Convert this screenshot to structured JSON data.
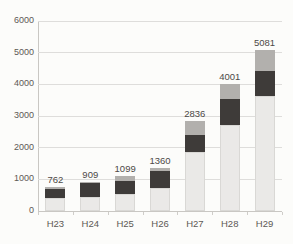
{
  "chart_data": {
    "type": "bar",
    "stacked": true,
    "title": "",
    "xlabel": "",
    "ylabel": "",
    "categories": [
      "H23",
      "H24",
      "H25",
      "H26",
      "H27",
      "H28",
      "H29"
    ],
    "totals": [
      762,
      909,
      1099,
      1360,
      2836,
      4001,
      5081
    ],
    "bar_labels": [
      "762",
      "909",
      "1099",
      "1360",
      "2836",
      "4001",
      "5081"
    ],
    "series": [
      {
        "name": "bottom-segment",
        "color": "#eae9e7",
        "values": [
          400,
          450,
          530,
          720,
          1850,
          2730,
          3620
        ]
      },
      {
        "name": "middle-segment",
        "color": "#3e3b39",
        "values": [
          290,
          420,
          404,
          532,
          550,
          795,
          814
        ]
      },
      {
        "name": "top-segment",
        "color": "#b2b0ad",
        "values": [
          72,
          39,
          165,
          108,
          436,
          476,
          647
        ]
      }
    ],
    "ylim": [
      0,
      6000
    ],
    "ytick_interval": 1000,
    "yticks": [
      "0",
      "1000",
      "2000",
      "3000",
      "4000",
      "5000",
      "6000"
    ],
    "grid": true,
    "legend": false
  },
  "style_colors": {
    "background": "#fcfcfa",
    "gridline": "#dedddb",
    "axis_line": "#c9c7c3",
    "tick_label": "#5d5955",
    "value_label": "#4c4946",
    "segment_bottom": "#eae9e7",
    "segment_bottom_border": "#d9d8d5",
    "segment_middle": "#3e3b39",
    "segment_top": "#b2b0ad"
  }
}
